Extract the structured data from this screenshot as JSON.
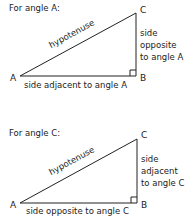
{
  "diagrams": [
    {
      "title": "For angle A:",
      "vertices": {
        "A": "A",
        "B": "B",
        "C": "C"
      },
      "hypotenuse": "hypotenuse",
      "vertical_side": [
        "side",
        "opposite",
        "to angle A"
      ],
      "horizontal_side": "side adjacent to angle A"
    },
    {
      "title": "For angle C:",
      "vertices": {
        "A": "A",
        "B": "B",
        "C": "C"
      },
      "hypotenuse": "hypotenuse",
      "vertical_side": [
        "side",
        "adjacent",
        "to angle C"
      ],
      "horizontal_side": "side opposite to angle C"
    }
  ],
  "colors": {
    "line": "#222222",
    "text": "#222222"
  }
}
